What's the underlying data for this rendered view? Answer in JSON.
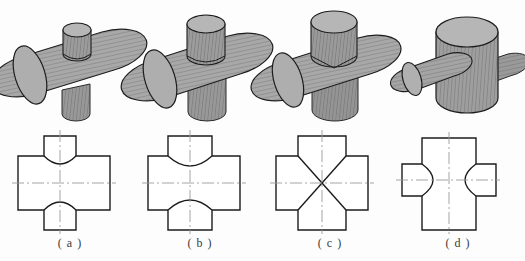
{
  "page": {
    "background_color": "#fdfdfd",
    "width": 525,
    "height": 261
  },
  "style": {
    "outline_color": "#1c1c1c",
    "centerline_color": "#9a9a9a",
    "solid_face_light": "#b4b4b4",
    "solid_face_mid": "#a0a0a0",
    "solid_face_dark": "#8a8a8a",
    "hatch_color": "#4a4a4a",
    "edge_color": "#2a2a2a"
  },
  "figures": [
    {
      "id": "a",
      "label": "( a )",
      "label_x": 40,
      "label_y": 236,
      "pictorial": {
        "name": "horizontal-cylinder-with-small-vertical-cylinder",
        "x": 6,
        "y": 4,
        "width": 126,
        "height": 118,
        "dominant_axis": "horizontal",
        "horizontal_radius": 30,
        "vertical_radius": 17,
        "description": "Large horizontal cylinder pierced by a smaller vertical cylinder"
      },
      "ortho": {
        "name": "front-view-small-vertical-branch",
        "x": 14,
        "y": 134,
        "width": 100,
        "height": 96,
        "main_rect": {
          "x": 4,
          "y": 22,
          "w": 92,
          "h": 54
        },
        "stub_rect": {
          "x": 30,
          "y": 2,
          "w": 32,
          "h": 20
        },
        "curve_direction": "inward-narrow",
        "curve_depth": 11,
        "intersection_type": "curve",
        "centerlines": [
          "horizontal",
          "vertical"
        ]
      }
    },
    {
      "id": "b",
      "label": "( b )",
      "label_x": 170,
      "label_y": 236,
      "pictorial": {
        "name": "horizontal-cylinder-with-medium-vertical-cylinder",
        "x": 134,
        "y": 4,
        "width": 126,
        "height": 118,
        "dominant_axis": "horizontal",
        "horizontal_radius": 30,
        "vertical_radius": 23,
        "description": "Large horizontal cylinder pierced by a medium vertical cylinder"
      },
      "ortho": {
        "name": "front-view-medium-vertical-branch",
        "x": 144,
        "y": 134,
        "width": 100,
        "height": 96,
        "main_rect": {
          "x": 4,
          "y": 22,
          "w": 92,
          "h": 54
        },
        "stub_rect": {
          "x": 24,
          "y": 2,
          "w": 44,
          "h": 20
        },
        "curve_direction": "inward-wide",
        "curve_depth": 15,
        "intersection_type": "curve",
        "centerlines": [
          "horizontal",
          "vertical"
        ]
      }
    },
    {
      "id": "c",
      "label": "( c )",
      "label_x": 300,
      "label_y": 236,
      "pictorial": {
        "name": "equal-diameter-cross-cylinders",
        "x": 262,
        "y": 4,
        "width": 126,
        "height": 118,
        "dominant_axis": "equal",
        "horizontal_radius": 28,
        "vertical_radius": 28,
        "description": "Two equal diameter cylinders intersecting at right angles"
      },
      "ortho": {
        "name": "front-view-equal-diameter-cross",
        "x": 272,
        "y": 134,
        "width": 100,
        "height": 96,
        "main_rect": {
          "x": 4,
          "y": 22,
          "w": 92,
          "h": 54
        },
        "stub_rect": {
          "x": 26,
          "y": 2,
          "w": 48,
          "h": 20
        },
        "curve_direction": "straight-diagonal",
        "curve_depth": 0,
        "intersection_type": "line",
        "centerlines": [
          "horizontal",
          "vertical"
        ]
      }
    },
    {
      "id": "d",
      "label": "( d )",
      "label_x": 428,
      "label_y": 236,
      "pictorial": {
        "name": "vertical-cylinder-with-small-horizontal-cylinder",
        "x": 392,
        "y": 4,
        "width": 126,
        "height": 118,
        "dominant_axis": "vertical",
        "horizontal_radius": 18,
        "vertical_radius": 31,
        "description": "Large vertical cylinder pierced by a smaller horizontal cylinder"
      },
      "ortho": {
        "name": "front-view-small-horizontal-branch",
        "x": 400,
        "y": 134,
        "width": 100,
        "height": 96,
        "main_rect": {
          "x": 22,
          "y": 4,
          "w": 54,
          "h": 92
        },
        "stub_rect": {
          "x": 2,
          "y": 30,
          "w": 20,
          "h": 32
        },
        "curve_direction": "outward-horizontal",
        "curve_depth": 22,
        "intersection_type": "curve",
        "centerlines": [
          "horizontal",
          "vertical"
        ]
      }
    }
  ]
}
